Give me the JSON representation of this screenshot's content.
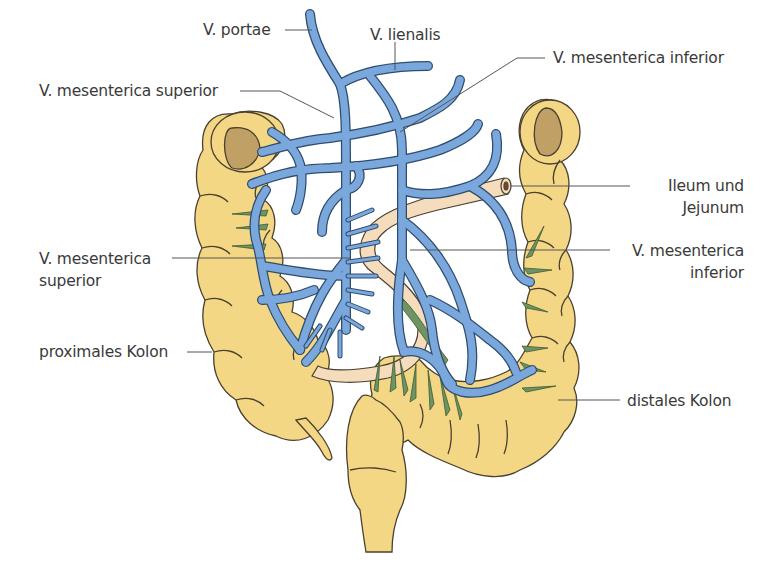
{
  "diagram": {
    "colors": {
      "vein": "#7aa8dc",
      "vein_outline": "#2f4c6e",
      "colon": "#f4d785",
      "colon_outline": "#4a4030",
      "ileum": "#f5dcbc",
      "lumen": "#b89a5c",
      "lymph_green": "#6f9464",
      "leader_line": "#555555"
    },
    "labels": {
      "v_portae": "V. portae",
      "v_lienalis": "V. lienalis",
      "v_mesenterica_superior_top": "V. mesenterica superior",
      "v_mesenterica_inferior_top": "V. mesenterica inferior",
      "ileum_jejunum_line1": "Ileum und",
      "ileum_jejunum_line2": "Jejunum",
      "v_mesenterica_superior_mid_line1": "V. mesenterica",
      "v_mesenterica_superior_mid_line2": "superior",
      "v_mesenterica_inferior_mid_line1": "V. mesenterica",
      "v_mesenterica_inferior_mid_line2": "inferior",
      "proximales_kolon": "proximales Kolon",
      "distales_kolon": "distales Kolon"
    }
  }
}
